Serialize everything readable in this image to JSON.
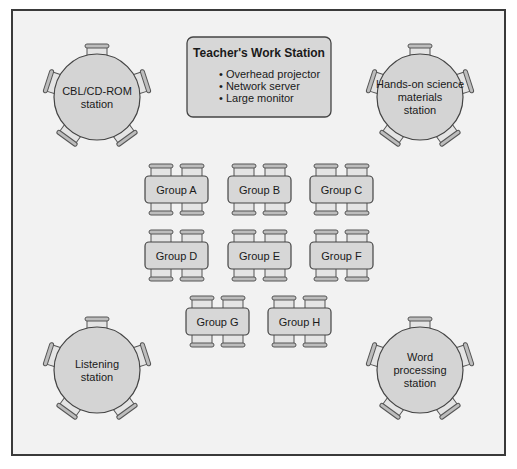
{
  "diagram": {
    "frame": {
      "x": 12,
      "y": 10,
      "w": 493,
      "h": 445
    },
    "teacher_station": {
      "title": "Teacher's Work Station",
      "items": [
        "• Overhead projector",
        "• Network server",
        "• Large monitor"
      ],
      "x": 187,
      "y": 37,
      "w": 144,
      "h": 80
    },
    "stations": [
      {
        "id": "cbl",
        "lines": [
          "CBL/CD-ROM",
          "station"
        ],
        "cx": 97,
        "cy": 97,
        "r": 43
      },
      {
        "id": "hands-on",
        "lines": [
          "Hands-on science",
          "materials",
          "station"
        ],
        "cx": 420,
        "cy": 97,
        "r": 43
      },
      {
        "id": "listening",
        "lines": [
          "Listening",
          "station"
        ],
        "cx": 97,
        "cy": 370,
        "r": 43
      },
      {
        "id": "word",
        "lines": [
          "Word",
          "processing",
          "station"
        ],
        "cx": 420,
        "cy": 370,
        "r": 43
      }
    ],
    "groups": [
      {
        "label": "Group A",
        "x": 145,
        "y": 176
      },
      {
        "label": "Group B",
        "x": 228,
        "y": 176
      },
      {
        "label": "Group C",
        "x": 310,
        "y": 176
      },
      {
        "label": "Group D",
        "x": 145,
        "y": 242
      },
      {
        "label": "Group E",
        "x": 228,
        "y": 242
      },
      {
        "label": "Group F",
        "x": 310,
        "y": 242
      },
      {
        "label": "Group G",
        "x": 186,
        "y": 308
      },
      {
        "label": "Group H",
        "x": 268,
        "y": 308
      }
    ],
    "table_size": {
      "w": 63,
      "h": 27
    },
    "colors": {
      "frame_fill": "#f2f2f2",
      "fill": "#d6d6d6",
      "stroke": "#444444"
    }
  }
}
